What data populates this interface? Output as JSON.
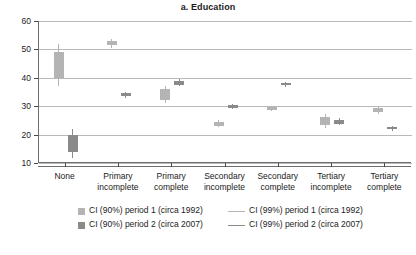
{
  "chart_data": {
    "type": "scatter",
    "title": "a. Education",
    "xlabel": "",
    "ylabel": "Percent",
    "ylim": [
      10,
      60
    ],
    "yticks": [
      10,
      20,
      30,
      40,
      50,
      60
    ],
    "grid": true,
    "legend_position": "bottom",
    "categories": [
      "None",
      "Primary\nincomplete",
      "Primary\ncomplete",
      "Secondary\nincomplete",
      "Secondary\ncomplete",
      "Tertiary\nincomplete",
      "Tertiary\ncomplete"
    ],
    "series": [
      {
        "name": "CI (90%) period 1 (circa 1992)",
        "color": "#b4b4b4",
        "values": [
          44.0,
          52.2,
          34.3,
          24.0,
          29.2,
          24.7,
          28.7
        ],
        "ci90_low": [
          40.0,
          51.4,
          32.3,
          23.2,
          28.7,
          23.3,
          28.0
        ],
        "ci90_high": [
          49.0,
          53.0,
          36.0,
          24.6,
          29.7,
          26.1,
          29.4
        ],
        "ci99_low": [
          37.2,
          50.6,
          31.0,
          22.6,
          28.2,
          22.3,
          27.4
        ],
        "ci99_high": [
          51.8,
          53.8,
          37.2,
          25.2,
          30.2,
          27.1,
          30.0
        ]
      },
      {
        "name": "CI (90%) period 2 (circa 2007)",
        "color": "#8a8a8a",
        "values": [
          17.0,
          34.0,
          38.3,
          29.9,
          37.7,
          24.6,
          22.2
        ],
        "ci90_low": [
          14.0,
          33.5,
          37.6,
          29.4,
          37.3,
          23.9,
          21.8
        ],
        "ci90_high": [
          20.0,
          34.5,
          39.0,
          30.4,
          38.1,
          25.3,
          22.6
        ],
        "ci99_low": [
          11.6,
          33.0,
          37.0,
          28.9,
          36.9,
          23.3,
          21.4
        ],
        "ci99_high": [
          22.0,
          35.0,
          39.6,
          30.9,
          38.5,
          25.9,
          23.0
        ]
      }
    ],
    "legend": [
      {
        "label": "CI (90%) period 1 (circa 1992)",
        "marker": "swatch",
        "color": "#b4b4b4"
      },
      {
        "label": "CI (99%) period 1 (circa 1992)",
        "marker": "line",
        "color": "#b4b4b4"
      },
      {
        "label": "CI (90%) period 2 (circa 2007)",
        "marker": "swatch",
        "color": "#8a8a8a"
      },
      {
        "label": "CI (99%) period 2 (circa 2007)",
        "marker": "line",
        "color": "#8a8a8a"
      }
    ]
  }
}
